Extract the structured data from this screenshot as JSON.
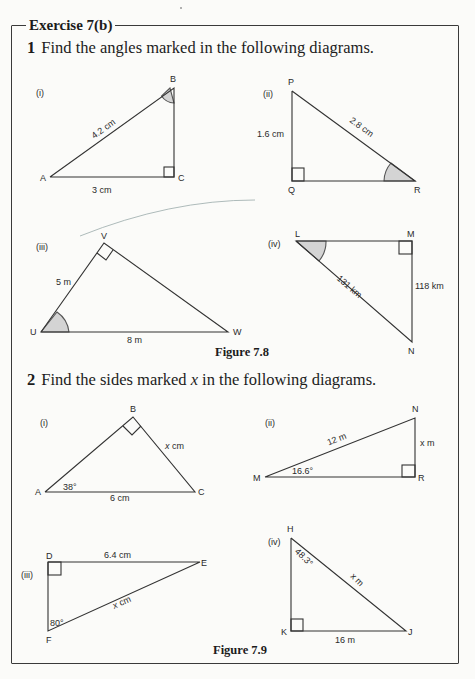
{
  "exercise": {
    "title": "Exercise 7(b)"
  },
  "question1": {
    "number": "1",
    "text": "Find the angles marked in the following diagrams.",
    "figure_caption": "Figure 7.8",
    "diagrams": [
      {
        "label": "(i)",
        "vertices": [
          "A",
          "B",
          "C"
        ],
        "right_angle_at": "C",
        "marked_angle_at": "B",
        "sides": {
          "AB": "4.2 cm",
          "AC": "3 cm"
        }
      },
      {
        "label": "(ii)",
        "vertices": [
          "P",
          "Q",
          "R"
        ],
        "right_angle_at": "Q",
        "marked_angle_at": "R",
        "sides": {
          "PR": "2.8 cm",
          "PQ": "1.6 cm"
        }
      },
      {
        "label": "(iii)",
        "vertices": [
          "U",
          "V",
          "W"
        ],
        "right_angle_at": "V",
        "marked_angle_at": "U",
        "sides": {
          "UV": "5 m",
          "UW": "8 m"
        }
      },
      {
        "label": "(iv)",
        "vertices": [
          "L",
          "M",
          "N"
        ],
        "right_angle_at": "M",
        "marked_angle_at": "L",
        "sides": {
          "LN": "131 km",
          "MN": "118 km"
        }
      }
    ]
  },
  "question2": {
    "number": "2",
    "text_before": "Find the sides marked ",
    "var": "x",
    "text_after": " in the following diagrams.",
    "figure_caption": "Figure 7.9",
    "diagrams": [
      {
        "label": "(i)",
        "vertices": [
          "A",
          "B",
          "C"
        ],
        "right_angle_at": "B",
        "angle": "38°",
        "sides": {
          "BC": "x cm",
          "AC": "6 cm"
        }
      },
      {
        "label": "(ii)",
        "vertices": [
          "M",
          "N",
          "R"
        ],
        "right_angle_at": "R",
        "angle": "16.6°",
        "sides": {
          "MN": "12 m",
          "NR": "x m"
        }
      },
      {
        "label": "(iii)",
        "vertices": [
          "D",
          "E",
          "F"
        ],
        "right_angle_at": "D",
        "angle": "80°",
        "sides": {
          "DE": "6.4 cm",
          "EF": "x cm"
        }
      },
      {
        "label": "(iv)",
        "vertices": [
          "H",
          "J",
          "K"
        ],
        "right_angle_at": "K",
        "angle": "48.3°",
        "sides": {
          "HJ": "x m",
          "KJ": "16 m"
        }
      }
    ]
  }
}
